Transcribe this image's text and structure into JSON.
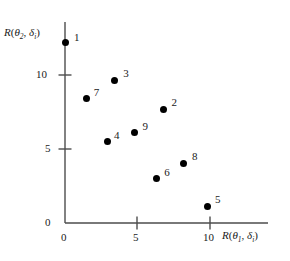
{
  "chart_data": {
    "type": "scatter",
    "title": "",
    "xlabel": "R(θ₁, δᵢ)",
    "ylabel": "R(θ₂, δᵢ)",
    "xlim": [
      0,
      11.5
    ],
    "ylim": [
      0,
      13.5
    ],
    "xticks": [
      0,
      5,
      10
    ],
    "xtick_labels": [
      "0",
      "5",
      "10"
    ],
    "yticks": [
      0,
      5,
      10
    ],
    "ytick_labels": [
      "0",
      "5",
      "10"
    ],
    "grid": false,
    "legend": "none",
    "point_labels": [
      "1",
      "2",
      "3",
      "4",
      "5",
      "6",
      "7",
      "8",
      "9"
    ],
    "points": [
      {
        "label": "1",
        "x": 0.0,
        "y": 12.2,
        "label_dx": 9,
        "label_dy": -11
      },
      {
        "label": "2",
        "x": 6.8,
        "y": 7.7,
        "label_dx": 8,
        "label_dy": -13
      },
      {
        "label": "3",
        "x": 3.4,
        "y": 9.6,
        "label_dx": 9,
        "label_dy": -14
      },
      {
        "label": "4",
        "x": 2.9,
        "y": 5.5,
        "label_dx": 7,
        "label_dy": -13
      },
      {
        "label": "5",
        "x": 9.8,
        "y": 1.1,
        "label_dx": 8,
        "label_dy": -14
      },
      {
        "label": "6",
        "x": 6.3,
        "y": 3.0,
        "label_dx": 8,
        "label_dy": -13
      },
      {
        "label": "7",
        "x": 1.5,
        "y": 8.4,
        "label_dx": 7,
        "label_dy": -13
      },
      {
        "label": "8",
        "x": 8.2,
        "y": 4.0,
        "label_dx": 8,
        "label_dy": -14
      },
      {
        "label": "9",
        "x": 4.8,
        "y": 6.1,
        "label_dx": 8,
        "label_dy": -13
      }
    ]
  },
  "axes": {
    "x_title_parts": {
      "fn": "R",
      "open": "(",
      "theta": "θ",
      "theta_sub": "1",
      "comma": ", ",
      "delta": "δ",
      "delta_sub": "i",
      "close": ")"
    },
    "y_title_parts": {
      "fn": "R",
      "open": "(",
      "theta": "θ",
      "theta_sub": "2",
      "comma": ", ",
      "delta": "δ",
      "delta_sub": "i",
      "close": ")"
    }
  },
  "colors": {
    "axis": "#4d4d4d",
    "point": "#000000",
    "text": "#1a1a1a",
    "background": "#ffffff"
  }
}
